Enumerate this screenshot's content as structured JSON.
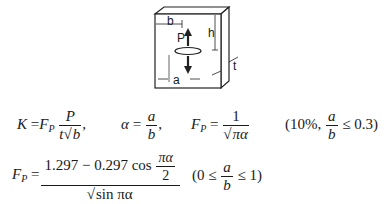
{
  "figure": {
    "labels": {
      "b": "b",
      "h": "h",
      "P": "P",
      "a": "a",
      "t": "t"
    }
  },
  "equations": {
    "eq1": {
      "lhs": "K",
      "eq": "=",
      "F": "F",
      "sub": "P",
      "num": "P",
      "den_t": "t",
      "den_b": "b",
      "comma": ","
    },
    "eq2": {
      "lhs": "α",
      "eq": "=",
      "num": "a",
      "den": "b",
      "comma": ","
    },
    "eq3": {
      "F": "F",
      "sub": "P",
      "eq": "=",
      "num": "1",
      "rad": "πα"
    },
    "cond1": {
      "open": "(10%,",
      "num": "a",
      "den": "b",
      "rel": "≤ 0.3)"
    },
    "eq4": {
      "F": "F",
      "sub": "P",
      "eq": "=",
      "num_a": "1.297 − 0.297 cos",
      "cos_num": "πα",
      "cos_den": "2",
      "rad": "sin πα"
    },
    "cond2": {
      "open": "(0 ≤",
      "num": "a",
      "den": "b",
      "rel": "≤ 1)"
    }
  }
}
